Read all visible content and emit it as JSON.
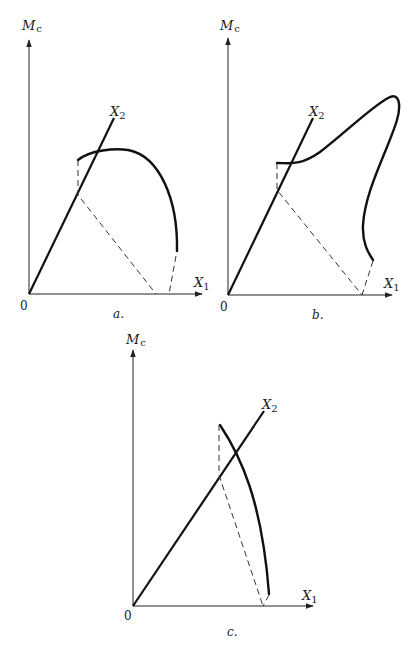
{
  "figure": {
    "panels": [
      {
        "id": "a",
        "caption": "a.",
        "axis_labels": {
          "vertical": "M",
          "vertical_sub": "c",
          "diagonal": "X",
          "diagonal_sub": "2",
          "horizontal": "X",
          "horizontal_sub": "1"
        },
        "origin_label": "0"
      },
      {
        "id": "b",
        "caption": "b.",
        "axis_labels": {
          "vertical": "M",
          "vertical_sub": "c",
          "diagonal": "X",
          "diagonal_sub": "2",
          "horizontal": "X",
          "horizontal_sub": "1"
        },
        "origin_label": "0"
      },
      {
        "id": "c",
        "caption": "c.",
        "axis_labels": {
          "vertical": "M",
          "vertical_sub": "c",
          "diagonal": "X",
          "diagonal_sub": "2",
          "horizontal": "X",
          "horizontal_sub": "1"
        },
        "origin_label": "0"
      }
    ],
    "colors": {
      "ink": "#111111",
      "background": "#ffffff"
    }
  }
}
